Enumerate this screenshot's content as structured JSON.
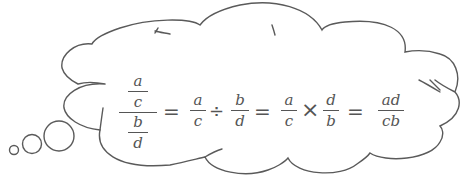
{
  "figure": {
    "type": "thought-bubble-formula",
    "stroke_color": "#5a5a5a",
    "text_color": "#555555",
    "background": "#ffffff"
  },
  "formula": {
    "description": "Dividing fractions: (a/c)/(b/d) = a/c ÷ b/d = a/c × d/b = ad/cb",
    "complex_fraction": {
      "top": {
        "num": "a",
        "den": "c"
      },
      "bottom": {
        "num": "b",
        "den": "d"
      }
    },
    "eq1": "=",
    "term1": {
      "num": "a",
      "den": "c"
    },
    "div_op": "÷",
    "term2": {
      "num": "b",
      "den": "d"
    },
    "eq2": "=",
    "term3": {
      "num": "a",
      "den": "c"
    },
    "mul_op": "×",
    "term4": {
      "num": "d",
      "den": "b"
    },
    "eq3": "=",
    "result": {
      "num": "ad",
      "den": "cb"
    }
  },
  "bubbles": [
    {
      "name": "small",
      "cx": 14,
      "cy": 150,
      "r": 4.5
    },
    {
      "name": "medium",
      "cx": 32,
      "cy": 144,
      "r": 9.5
    },
    {
      "name": "large",
      "cx": 59,
      "cy": 136,
      "r": 15
    }
  ]
}
